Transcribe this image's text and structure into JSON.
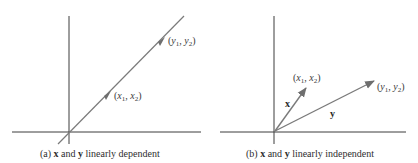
{
  "colors": {
    "axis": "#3c3c3c",
    "vector": "#777777",
    "text": "#2e2e2e"
  },
  "panel_a": {
    "caption": {
      "prefix": "(a) ",
      "x": "x",
      "mid": " and ",
      "y": "y",
      "suffix": " linearly dependent"
    },
    "points": [
      {
        "name": "x",
        "label_base1": "x",
        "sub1": "1",
        "label_base2": "x",
        "sub2": "2"
      },
      {
        "name": "y",
        "label_base1": "y",
        "sub1": "1",
        "label_base2": "y",
        "sub2": "2"
      }
    ]
  },
  "panel_b": {
    "caption": {
      "prefix": "(b) ",
      "x": "x",
      "mid": " and ",
      "y": "y",
      "suffix": " linearly independent"
    },
    "points": [
      {
        "name": "x",
        "label_base1": "x",
        "sub1": "1",
        "label_base2": "x",
        "sub2": "2"
      },
      {
        "name": "y",
        "label_base1": "y",
        "sub1": "1",
        "label_base2": "y",
        "sub2": "2"
      }
    ],
    "vector_labels": {
      "x": "x",
      "y": "y"
    }
  }
}
